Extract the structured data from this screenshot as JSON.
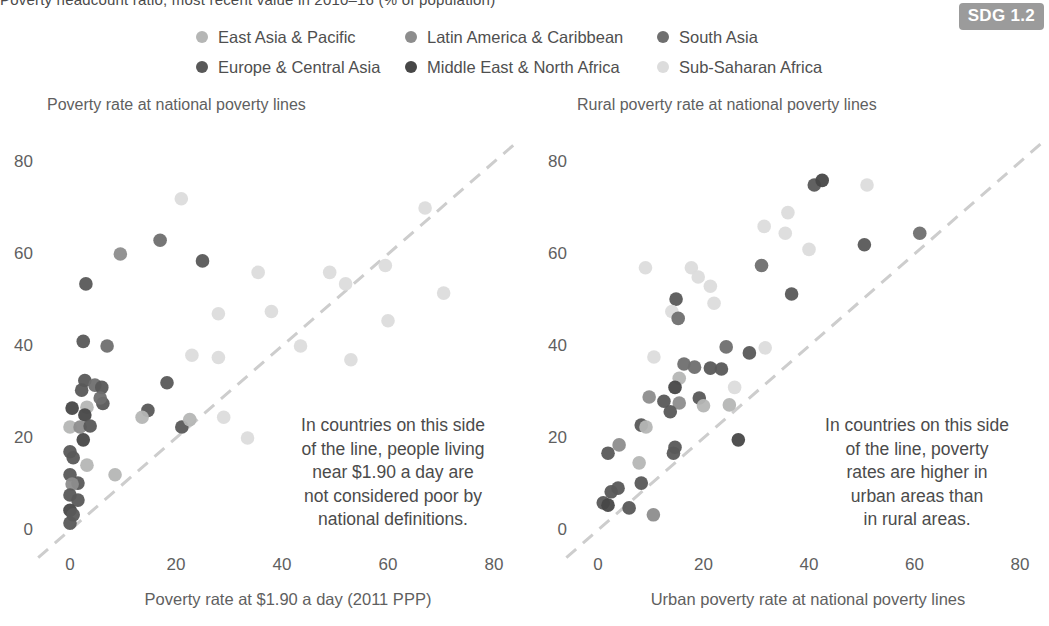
{
  "caption": "Poverty headcount ratio, most recent value in 2010–16 (% of population)",
  "badge": {
    "label": "SDG 1.2",
    "bg": "#9b9b9b"
  },
  "legend": {
    "items": [
      {
        "key": "EAP",
        "label": "East Asia & Pacific",
        "color": "#b5b6b5"
      },
      {
        "key": "LAC",
        "label": "Latin America & Caribbean",
        "color": "#8d8d8d"
      },
      {
        "key": "SA",
        "label": "South Asia",
        "color": "#6f6f6f"
      },
      {
        "key": "ECA",
        "label": "Europe & Central Asia",
        "color": "#585858"
      },
      {
        "key": "MENA",
        "label": "Middle East & North Africa",
        "color": "#474747"
      },
      {
        "key": "SSA",
        "label": "Sub-Saharan Africa",
        "color": "#dcdcdc"
      }
    ]
  },
  "styles": {
    "diagonal_color": "#cdcdcd",
    "point_radius": 6.8
  },
  "annotations": {
    "left": [
      "In countries on this side",
      "of the line, people living",
      "near $1.90 a day are",
      "not considered poor by",
      "national definitions."
    ],
    "right": [
      "In countries on this side",
      "of the line, poverty",
      "rates are higher in",
      "urban areas than",
      "in rural areas."
    ]
  },
  "chart_data": [
    {
      "type": "scatter",
      "title": "Poverty rate at national poverty lines",
      "xlabel": "Poverty rate at $1.90 a day (2011 PPP)",
      "ylabel": "",
      "xlim": [
        0,
        80
      ],
      "ylim": [
        0,
        80
      ],
      "xticks": [
        0,
        20,
        40,
        60,
        80
      ],
      "yticks": [
        0,
        20,
        40,
        60,
        80
      ],
      "diagonal_line": "y = x (dashed)",
      "annotation": "In countries on this side of the line, people living near $1.90 a day are not considered poor by national definitions.",
      "points": [
        {
          "x": 21,
          "y": 72,
          "region": "SSA"
        },
        {
          "x": 67,
          "y": 70,
          "region": "SSA"
        },
        {
          "x": 17,
          "y": 63,
          "region": "SA"
        },
        {
          "x": 9.5,
          "y": 60,
          "region": "LAC"
        },
        {
          "x": 25,
          "y": 58.5,
          "region": "ECA"
        },
        {
          "x": 3,
          "y": 53.5,
          "region": "ECA"
        },
        {
          "x": 35.5,
          "y": 56,
          "region": "SSA"
        },
        {
          "x": 49,
          "y": 56,
          "region": "SSA"
        },
        {
          "x": 52,
          "y": 53.5,
          "region": "SSA"
        },
        {
          "x": 59.5,
          "y": 57.5,
          "region": "SSA"
        },
        {
          "x": 70.5,
          "y": 51.5,
          "region": "SSA"
        },
        {
          "x": 28,
          "y": 47,
          "region": "SSA"
        },
        {
          "x": 38,
          "y": 47.5,
          "region": "SSA"
        },
        {
          "x": 60,
          "y": 45.5,
          "region": "SSA"
        },
        {
          "x": 2.5,
          "y": 41,
          "region": "ECA"
        },
        {
          "x": 7,
          "y": 40,
          "region": "SA"
        },
        {
          "x": 23,
          "y": 38,
          "region": "SSA"
        },
        {
          "x": 28,
          "y": 37.5,
          "region": "SSA"
        },
        {
          "x": 43.5,
          "y": 40,
          "region": "SSA"
        },
        {
          "x": 53,
          "y": 37,
          "region": "SSA"
        },
        {
          "x": 18.3,
          "y": 32,
          "region": "ECA"
        },
        {
          "x": 2.8,
          "y": 32.5,
          "region": "ECA"
        },
        {
          "x": 4.7,
          "y": 31.5,
          "region": "SA"
        },
        {
          "x": 2.2,
          "y": 30.4,
          "region": "ECA"
        },
        {
          "x": 6,
          "y": 31,
          "region": "ECA"
        },
        {
          "x": 6.2,
          "y": 27.5,
          "region": "ECA"
        },
        {
          "x": 5.7,
          "y": 28.7,
          "region": "SA"
        },
        {
          "x": 0.4,
          "y": 26.5,
          "region": "MENA"
        },
        {
          "x": 3.2,
          "y": 26.7,
          "region": "EAP"
        },
        {
          "x": 2.8,
          "y": 25,
          "region": "MENA"
        },
        {
          "x": 14.7,
          "y": 26,
          "region": "ECA"
        },
        {
          "x": 13.6,
          "y": 24.5,
          "region": "EAP"
        },
        {
          "x": 21.1,
          "y": 22.4,
          "region": "ECA"
        },
        {
          "x": 22.6,
          "y": 24,
          "region": "EAP"
        },
        {
          "x": 29,
          "y": 24.5,
          "region": "SSA"
        },
        {
          "x": 33.5,
          "y": 20,
          "region": "SSA"
        },
        {
          "x": 0,
          "y": 22.4,
          "region": "EAP"
        },
        {
          "x": 1.9,
          "y": 22.4,
          "region": "LAC"
        },
        {
          "x": 3.8,
          "y": 22.6,
          "region": "ECA"
        },
        {
          "x": 2.5,
          "y": 19.6,
          "region": "MENA"
        },
        {
          "x": 0,
          "y": 17,
          "region": "ECA"
        },
        {
          "x": 0.6,
          "y": 15.7,
          "region": "ECA"
        },
        {
          "x": 3.2,
          "y": 14.1,
          "region": "EAP"
        },
        {
          "x": 8.5,
          "y": 12,
          "region": "EAP"
        },
        {
          "x": 0,
          "y": 12,
          "region": "ECA"
        },
        {
          "x": 1.5,
          "y": 10.2,
          "region": "ECA"
        },
        {
          "x": 0.4,
          "y": 10,
          "region": "LAC"
        },
        {
          "x": 0,
          "y": 7.6,
          "region": "ECA"
        },
        {
          "x": 1.5,
          "y": 6.5,
          "region": "ECA"
        },
        {
          "x": 0,
          "y": 4.3,
          "region": "MENA"
        },
        {
          "x": 0.6,
          "y": 3.3,
          "region": "ECA"
        },
        {
          "x": 0,
          "y": 1.5,
          "region": "ECA"
        }
      ]
    },
    {
      "type": "scatter",
      "title": "Rural poverty rate at national poverty lines",
      "xlabel": "Urban poverty rate at national poverty lines",
      "ylabel": "",
      "xlim": [
        0,
        80
      ],
      "ylim": [
        0,
        80
      ],
      "xticks": [
        0,
        20,
        40,
        60,
        80
      ],
      "yticks": [
        0,
        20,
        40,
        60,
        80
      ],
      "diagonal_line": "y = x (dashed)",
      "annotation": "In countries on this side of the line, poverty rates are higher in urban areas than in rural areas.",
      "points": [
        {
          "x": 41,
          "y": 75,
          "region": "ECA"
        },
        {
          "x": 42.5,
          "y": 76,
          "region": "MENA"
        },
        {
          "x": 51,
          "y": 75,
          "region": "SSA"
        },
        {
          "x": 36,
          "y": 69,
          "region": "SSA"
        },
        {
          "x": 31.5,
          "y": 66,
          "region": "SSA"
        },
        {
          "x": 35.5,
          "y": 64.5,
          "region": "SSA"
        },
        {
          "x": 61,
          "y": 64.5,
          "region": "SA"
        },
        {
          "x": 50.5,
          "y": 62,
          "region": "ECA"
        },
        {
          "x": 40,
          "y": 61,
          "region": "SSA"
        },
        {
          "x": 31,
          "y": 57.5,
          "region": "SA"
        },
        {
          "x": 9,
          "y": 57,
          "region": "SSA"
        },
        {
          "x": 17.7,
          "y": 57,
          "region": "SSA"
        },
        {
          "x": 19,
          "y": 55,
          "region": "SSA"
        },
        {
          "x": 21.3,
          "y": 53,
          "region": "SSA"
        },
        {
          "x": 14.8,
          "y": 50.2,
          "region": "ECA"
        },
        {
          "x": 14,
          "y": 47.5,
          "region": "SSA"
        },
        {
          "x": 15.2,
          "y": 46,
          "region": "SA"
        },
        {
          "x": 22,
          "y": 49.3,
          "region": "SSA"
        },
        {
          "x": 36.7,
          "y": 51.3,
          "region": "ECA"
        },
        {
          "x": 24.3,
          "y": 39.8,
          "region": "SA"
        },
        {
          "x": 10.6,
          "y": 37.6,
          "region": "SSA"
        },
        {
          "x": 28.7,
          "y": 38.5,
          "region": "ECA"
        },
        {
          "x": 31.7,
          "y": 39.6,
          "region": "SSA"
        },
        {
          "x": 16.3,
          "y": 36.1,
          "region": "SA"
        },
        {
          "x": 18.3,
          "y": 35.4,
          "region": "SA"
        },
        {
          "x": 21.3,
          "y": 35.2,
          "region": "ECA"
        },
        {
          "x": 23.4,
          "y": 35,
          "region": "ECA"
        },
        {
          "x": 15.4,
          "y": 33,
          "region": "EAP"
        },
        {
          "x": 14.6,
          "y": 31,
          "region": "MENA"
        },
        {
          "x": 9.7,
          "y": 28.9,
          "region": "LAC"
        },
        {
          "x": 12.5,
          "y": 28,
          "region": "ECA"
        },
        {
          "x": 15.4,
          "y": 27.6,
          "region": "LAC"
        },
        {
          "x": 19.2,
          "y": 28.7,
          "region": "ECA"
        },
        {
          "x": 20,
          "y": 27,
          "region": "EAP"
        },
        {
          "x": 13.7,
          "y": 25.7,
          "region": "ECA"
        },
        {
          "x": 25.9,
          "y": 31,
          "region": "SSA"
        },
        {
          "x": 24.9,
          "y": 27.2,
          "region": "EAP"
        },
        {
          "x": 8.2,
          "y": 22.8,
          "region": "ECA"
        },
        {
          "x": 9.1,
          "y": 22.4,
          "region": "EAP"
        },
        {
          "x": 4,
          "y": 18.5,
          "region": "LAC"
        },
        {
          "x": 1.9,
          "y": 16.7,
          "region": "ECA"
        },
        {
          "x": 14.3,
          "y": 16.7,
          "region": "ECA"
        },
        {
          "x": 14.6,
          "y": 18,
          "region": "ECA"
        },
        {
          "x": 7.8,
          "y": 14.6,
          "region": "EAP"
        },
        {
          "x": 26.6,
          "y": 19.6,
          "region": "MENA"
        },
        {
          "x": 8.2,
          "y": 10.2,
          "region": "ECA"
        },
        {
          "x": 2.5,
          "y": 8.3,
          "region": "ECA"
        },
        {
          "x": 3.8,
          "y": 9.1,
          "region": "ECA"
        },
        {
          "x": 1,
          "y": 5.9,
          "region": "ECA"
        },
        {
          "x": 1.9,
          "y": 5.4,
          "region": "MENA"
        },
        {
          "x": 5.9,
          "y": 4.8,
          "region": "ECA"
        },
        {
          "x": 10.5,
          "y": 3.3,
          "region": "LAC"
        }
      ]
    }
  ]
}
